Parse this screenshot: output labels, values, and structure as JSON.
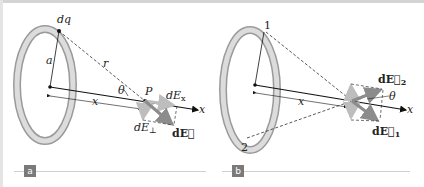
{
  "figure": {
    "panel_a": {
      "badge": "a",
      "labels": {
        "dq": "dq",
        "a": "a",
        "r": "r",
        "theta": "θ",
        "P": "P",
        "x_dist": "x",
        "dEx": "dE",
        "dEx_sub": "x",
        "dEperp": "dE",
        "dEperp_sub": "⊥",
        "dE_vec": "dE⃗",
        "x_axis": "x"
      }
    },
    "panel_b": {
      "badge": "b",
      "labels": {
        "point1": "1",
        "point2": "2",
        "x_dist": "x",
        "theta": "θ",
        "dE2": "dE⃗",
        "dE2_sub": "2",
        "dE1": "dE⃗",
        "dE1_sub": "1",
        "x_axis": "x"
      }
    },
    "colors": {
      "ring_light": "#d9d9d9",
      "ring_dark": "#9a9a9a",
      "arrow_gray": "#8c8c8c",
      "arrow_light": "#bdbdbd",
      "badge": "#7a7a7a",
      "line": "#111111"
    }
  }
}
